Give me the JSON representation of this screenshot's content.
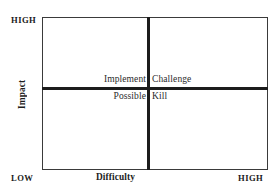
{
  "diagram": {
    "type": "2x2-matrix",
    "axes": {
      "y": {
        "title": "Impact",
        "high_label": "HIGH",
        "low_label": "LOW"
      },
      "x": {
        "title": "Difficulty",
        "low_label": "LOW",
        "high_label": "HIGH"
      }
    },
    "quadrants": {
      "top_left": "Implement",
      "top_right": "Challenge",
      "bottom_left": "Possible",
      "bottom_right": "Kill"
    },
    "colors": {
      "background": "#ffffff",
      "box_border": "#3a3a3a",
      "divider": "#1c1c1c",
      "text": "#1a1a1a",
      "quadrant_text": "#2b2b2b"
    }
  }
}
